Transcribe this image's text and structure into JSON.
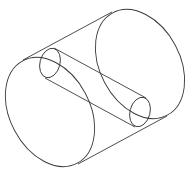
{
  "diagram": {
    "stroke_color": "#3a3a3a",
    "background": "#ffffff",
    "large_cylinder": {
      "front_face": {
        "cx": 50,
        "cy": 112,
        "rx": 40,
        "ry": 58,
        "rotate": -28
      },
      "back_face": {
        "cx": 140,
        "cy": 64,
        "rx": 40,
        "ry": 58,
        "rotate": -28
      },
      "top_edge": {
        "x1": 23,
        "y1": 60,
        "x2": 112,
        "y2": 12
      },
      "bottom_edge": {
        "x1": 78,
        "y1": 164,
        "x2": 167,
        "y2": 116
      }
    },
    "small_cylinder": {
      "back_face": {
        "cx": 50,
        "cy": 63,
        "rx": 10,
        "ry": 15,
        "rotate": 15
      },
      "front_face": {
        "cx": 140,
        "cy": 112,
        "rx": 10,
        "ry": 15,
        "rotate": 15
      },
      "top_edge": {
        "x1": 54,
        "y1": 48,
        "x2": 146,
        "y2": 98
      },
      "bottom_edge": {
        "x1": 45,
        "y1": 78,
        "x2": 135,
        "y2": 127
      }
    }
  }
}
